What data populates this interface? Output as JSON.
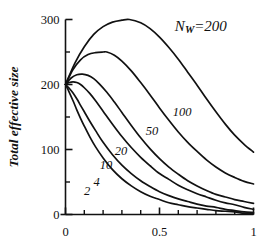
{
  "chart_data": {
    "type": "line",
    "title": "",
    "subtitle": "",
    "xlabel": "",
    "ylabel": "Total effective size",
    "xlim": [
      0,
      1
    ],
    "ylim": [
      0,
      300
    ],
    "grid": false,
    "legend": "inline-curve-labels",
    "x_ticks_major": [
      "0",
      "0.5",
      "1"
    ],
    "x_tick_values_major": [
      0,
      0.5,
      1
    ],
    "x_tick_values_minor": [
      0.1,
      0.2,
      0.3,
      0.4,
      0.6,
      0.7,
      0.8,
      0.9
    ],
    "y_ticks_major": [
      "0",
      "100",
      "200",
      "300"
    ],
    "y_tick_values_major": [
      0,
      100,
      200,
      300
    ],
    "y_tick_values_minor": [
      50,
      150,
      250
    ],
    "annotations": [
      {
        "name": "nw-annotation",
        "text": "N",
        "sub": "W",
        "tail": "=200",
        "x": 0.72,
        "y": 283
      }
    ],
    "series": [
      {
        "name": "100",
        "label": "100",
        "label_x": 0.62,
        "label_y": 152,
        "x": [
          0.0,
          0.05,
          0.1,
          0.15,
          0.2,
          0.25,
          0.3,
          0.34,
          0.4,
          0.45,
          0.5,
          0.55,
          0.6,
          0.65,
          0.7,
          0.75,
          0.8,
          0.85,
          0.9,
          0.95,
          1.0
        ],
        "y": [
          200,
          233,
          258,
          277,
          289,
          296,
          299,
          300,
          295,
          286,
          273,
          257,
          239,
          219,
          199,
          178,
          158,
          139,
          122,
          108,
          96
        ]
      },
      {
        "name": "50",
        "label": "50",
        "label_x": 0.46,
        "label_y": 122,
        "x": [
          0.0,
          0.04,
          0.08,
          0.12,
          0.16,
          0.2,
          0.22,
          0.26,
          0.3,
          0.35,
          0.4,
          0.45,
          0.5,
          0.55,
          0.6,
          0.65,
          0.7,
          0.75,
          0.8,
          0.85,
          0.9,
          0.95,
          1.0
        ],
        "y": [
          200,
          223,
          238,
          246,
          249,
          250,
          250,
          245,
          236,
          221,
          203,
          184,
          164,
          145,
          127,
          111,
          97,
          84,
          73,
          64,
          57,
          51,
          47
        ]
      },
      {
        "name": "20",
        "label": "20",
        "label_x": 0.295,
        "label_y": 92,
        "x": [
          0.0,
          0.03,
          0.06,
          0.09,
          0.12,
          0.15,
          0.18,
          0.22,
          0.26,
          0.3,
          0.35,
          0.4,
          0.45,
          0.5,
          0.55,
          0.6,
          0.65,
          0.7,
          0.75,
          0.8,
          0.85,
          0.9,
          0.95,
          1.0
        ],
        "y": [
          200,
          210,
          215,
          216,
          214,
          209,
          201,
          188,
          173,
          157,
          137,
          118,
          101,
          86,
          73,
          62,
          52,
          44,
          37,
          31,
          27,
          23,
          20,
          17
        ]
      },
      {
        "name": "10",
        "label": "10",
        "label_x": 0.215,
        "label_y": 70,
        "x": [
          0.0,
          0.02,
          0.04,
          0.06,
          0.08,
          0.1,
          0.13,
          0.16,
          0.2,
          0.25,
          0.3,
          0.35,
          0.4,
          0.45,
          0.5,
          0.55,
          0.6,
          0.65,
          0.7,
          0.75,
          0.8,
          0.85,
          0.9,
          0.95,
          1.0
        ],
        "y": [
          200,
          203,
          204,
          203,
          200,
          195,
          186,
          175,
          159,
          139,
          120,
          103,
          88,
          75,
          63,
          54,
          45,
          38,
          32,
          27,
          22,
          18,
          15,
          11,
          8
        ]
      },
      {
        "name": "4",
        "label": "4",
        "label_x": 0.165,
        "label_y": 44,
        "x": [
          0.0,
          0.02,
          0.04,
          0.06,
          0.08,
          0.1,
          0.13,
          0.16,
          0.2,
          0.25,
          0.3,
          0.35,
          0.4,
          0.45,
          0.5,
          0.55,
          0.6,
          0.65,
          0.7,
          0.75,
          0.8,
          0.85,
          0.9,
          0.95,
          1.0
        ],
        "y": [
          200,
          194,
          187,
          178,
          168,
          158,
          143,
          129,
          111,
          92,
          76,
          63,
          52,
          43,
          35,
          29,
          24,
          20,
          16,
          13,
          11,
          8,
          6,
          4,
          3
        ]
      },
      {
        "name": "2",
        "label": "2",
        "label_x": 0.115,
        "label_y": 30,
        "x": [
          0.0,
          0.02,
          0.04,
          0.06,
          0.08,
          0.1,
          0.13,
          0.16,
          0.2,
          0.25,
          0.3,
          0.35,
          0.4,
          0.45,
          0.5,
          0.55,
          0.6,
          0.65,
          0.7,
          0.75,
          0.8,
          0.85,
          0.9,
          0.95,
          1.0
        ],
        "y": [
          200,
          188,
          175,
          161,
          148,
          136,
          119,
          104,
          87,
          69,
          55,
          44,
          35,
          28,
          23,
          18,
          15,
          12,
          10,
          8,
          6,
          5,
          4,
          2,
          1
        ]
      }
    ]
  },
  "style": {
    "line_color": "#111111",
    "axis_color": "#111111",
    "background": "#ffffff"
  }
}
